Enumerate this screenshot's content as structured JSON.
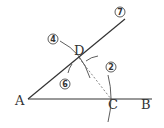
{
  "diagram": {
    "type": "geometric construction",
    "points": {
      "A": {
        "label": "A"
      },
      "B": {
        "label": "B"
      },
      "C": {
        "label": "C"
      },
      "D": {
        "label": "D"
      }
    },
    "step_markers": {
      "step2": "2",
      "step4": "4",
      "step6": "6",
      "step7": "7"
    },
    "colors": {
      "stroke": "#333333",
      "background": "#ffffff"
    }
  }
}
